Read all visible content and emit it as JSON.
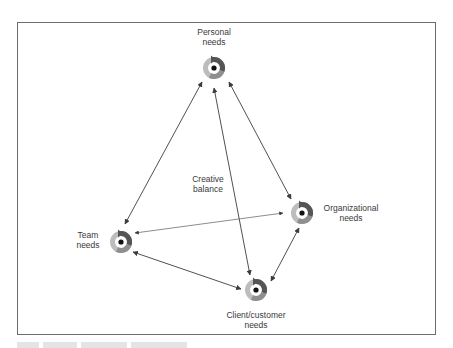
{
  "diagram": {
    "center_label": {
      "line1": "Creative",
      "line2": "balance"
    },
    "nodes": [
      {
        "id": "personal",
        "line1": "Personal",
        "line2": "needs",
        "icon": "cycle-icon"
      },
      {
        "id": "team",
        "line1": "Team",
        "line2": "needs",
        "icon": "cycle-icon"
      },
      {
        "id": "organizational",
        "line1": "Organizational",
        "line2": "needs",
        "icon": "cycle-icon"
      },
      {
        "id": "client",
        "line1": "Client/customer",
        "line2": "needs",
        "icon": "cycle-icon"
      }
    ],
    "edges": [
      {
        "from": "personal",
        "to": "team",
        "type": "bidirectional-arrow"
      },
      {
        "from": "personal",
        "to": "client",
        "type": "bidirectional-arrow"
      },
      {
        "from": "personal",
        "to": "organizational",
        "type": "bidirectional-arrow"
      },
      {
        "from": "team",
        "to": "organizational",
        "type": "bidirectional-arrow"
      },
      {
        "from": "team",
        "to": "client",
        "type": "bidirectional-arrow"
      },
      {
        "from": "organizational",
        "to": "client",
        "type": "bidirectional-arrow"
      }
    ],
    "colors": {
      "frame": "#6d6d6d",
      "arrow": "#3c3c3c",
      "text": "#3a3a3a",
      "cycle_dark": "#555555",
      "cycle_mid": "#8f8f8f",
      "cycle_light": "#bdbdbd",
      "center_dot": "#111111"
    }
  }
}
